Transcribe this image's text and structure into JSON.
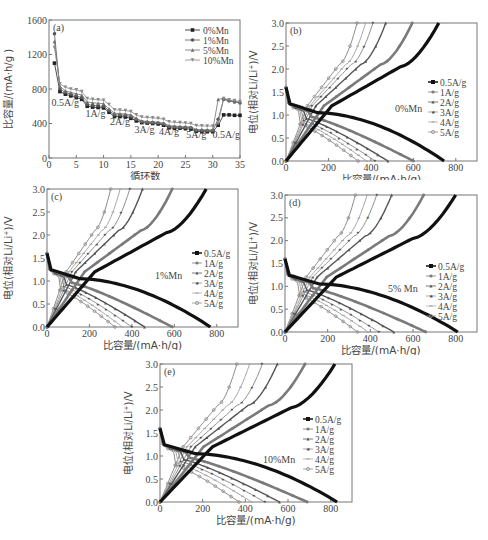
{
  "chart_data": [
    {
      "id": "a",
      "type": "scatter",
      "panel_label": "(a)",
      "xlabel": "循环数",
      "ylabel": "比容量/(mA·h/g )",
      "xlim": [
        0,
        35
      ],
      "ylim": [
        0,
        1600
      ],
      "xticks": [
        0,
        5,
        10,
        15,
        20,
        25,
        30,
        35
      ],
      "yticks": [
        0,
        400,
        800,
        1200,
        1600
      ],
      "legend": [
        "0%Mn",
        "1%Mn",
        "5%Mn",
        "10%Mn"
      ],
      "legend_position": "upper right",
      "annotations": [
        {
          "text": "0.5A/g",
          "x": 3,
          "y": 600
        },
        {
          "text": "1A/g",
          "x": 8.5,
          "y": 470
        },
        {
          "text": "2A/g",
          "x": 13,
          "y": 380
        },
        {
          "text": "3A/g",
          "x": 17.5,
          "y": 290
        },
        {
          "text": "4A/g",
          "x": 22,
          "y": 270
        },
        {
          "text": "5A/g",
          "x": 27,
          "y": 235
        },
        {
          "text": "0.5A/g",
          "x": 32.5,
          "y": 235
        }
      ],
      "x": [
        1,
        2,
        3,
        4,
        5,
        6,
        7,
        8,
        9,
        10,
        11,
        12,
        13,
        14,
        15,
        16,
        17,
        18,
        19,
        20,
        21,
        22,
        23,
        24,
        25,
        26,
        27,
        28,
        29,
        30,
        31,
        32,
        33,
        34,
        35
      ],
      "series": [
        {
          "name": "0%Mn",
          "marker": "square",
          "values": [
            1100,
            770,
            740,
            720,
            700,
            680,
            600,
            590,
            585,
            580,
            530,
            480,
            480,
            475,
            460,
            430,
            410,
            405,
            400,
            395,
            380,
            350,
            345,
            345,
            340,
            335,
            310,
            305,
            305,
            305,
            380,
            500,
            500,
            495,
            495
          ]
        },
        {
          "name": "1%Mn",
          "marker": "circle",
          "values": [
            1440,
            800,
            760,
            740,
            720,
            700,
            620,
            610,
            605,
            600,
            550,
            500,
            500,
            495,
            480,
            450,
            420,
            415,
            410,
            405,
            395,
            365,
            360,
            355,
            355,
            350,
            320,
            320,
            318,
            318,
            450,
            680,
            660,
            650,
            640
          ]
        },
        {
          "name": "5%Mn",
          "marker": "triangle-up",
          "values": [
            1350,
            830,
            780,
            760,
            745,
            730,
            650,
            640,
            635,
            630,
            570,
            520,
            515,
            510,
            500,
            460,
            430,
            425,
            420,
            415,
            405,
            375,
            370,
            365,
            362,
            360,
            330,
            328,
            326,
            325,
            680,
            690,
            670,
            655,
            645
          ]
        },
        {
          "name": "10%Mn",
          "marker": "triangle-down",
          "values": [
            1280,
            860,
            820,
            800,
            790,
            770,
            690,
            680,
            675,
            670,
            620,
            560,
            555,
            550,
            540,
            500,
            475,
            470,
            465,
            460,
            450,
            420,
            415,
            410,
            405,
            400,
            375,
            372,
            370,
            370,
            400,
            690,
            675,
            665,
            655
          ]
        }
      ]
    },
    {
      "id": "b",
      "type": "line",
      "panel_label": "(b)",
      "sample": "0%Mn",
      "xlabel": "比容量/(mA·h/g)",
      "ylabel": "电位(相对Li/Li⁺)/V",
      "xlim": [
        0,
        900
      ],
      "ylim": [
        0,
        3.0
      ],
      "xticks": [
        0,
        200,
        400,
        600,
        800
      ],
      "yticks": [
        0.0,
        0.5,
        1.0,
        1.5,
        2.0,
        2.5,
        3.0
      ],
      "legend": [
        "0.5A/g",
        "1A/g",
        "2A/g",
        "3A/g",
        "4A/g",
        "5A/g"
      ],
      "discharge_capacity": [
        745,
        600,
        480,
        420,
        380,
        340
      ],
      "charge_capacity": [
        720,
        595,
        470,
        410,
        375,
        335
      ]
    },
    {
      "id": "c",
      "type": "line",
      "panel_label": "(c)",
      "sample": "1%Mn",
      "xlabel": "比容量/(mA·h/g)",
      "ylabel": "电位(相对Li/Li⁺)/V",
      "xlim": [
        0,
        900
      ],
      "ylim": [
        0,
        3.0
      ],
      "xticks": [
        0,
        200,
        400,
        600,
        800
      ],
      "yticks": [
        0.0,
        0.5,
        1.0,
        1.5,
        2.0,
        2.5,
        3.0
      ],
      "legend": [
        "0.5A/g",
        "1A/g",
        "2A/g",
        "3A/g",
        "4A/g",
        "5A/g"
      ],
      "discharge_capacity": [
        770,
        590,
        460,
        400,
        355,
        320
      ],
      "charge_capacity": [
        750,
        590,
        450,
        390,
        345,
        300
      ]
    },
    {
      "id": "d",
      "type": "line",
      "panel_label": "(d)",
      "sample": "5% Mn",
      "xlabel": "比容量/(mA·h/g)",
      "ylabel": "电位(相对Li/Li⁺)/V",
      "xlim": [
        0,
        900
      ],
      "ylim": [
        0,
        3.0
      ],
      "xticks": [
        0,
        200,
        400,
        600,
        800
      ],
      "yticks": [
        0.0,
        0.5,
        1.0,
        1.5,
        2.0,
        2.5,
        3.0
      ],
      "legend": [
        "0.5A/g",
        "1A/g",
        "2A/g",
        "3A/g",
        "4A/g",
        "5A/g"
      ],
      "discharge_capacity": [
        810,
        660,
        510,
        440,
        390,
        340
      ],
      "charge_capacity": [
        800,
        650,
        500,
        430,
        385,
        330
      ]
    },
    {
      "id": "e",
      "type": "line",
      "panel_label": "(e)",
      "sample": "10%Mn",
      "xlabel": "比容量/(mA·h/g)",
      "ylabel": "电位(相对Li/Li⁺)/V",
      "xlim": [
        0,
        900
      ],
      "ylim": [
        0,
        3.0
      ],
      "xticks": [
        0,
        200,
        400,
        600,
        800
      ],
      "yticks": [
        0.0,
        0.5,
        1.0,
        1.5,
        2.0,
        2.5,
        3.0
      ],
      "legend": [
        "0.5A/g",
        "1A/g",
        "2A/g",
        "3A/g",
        "4A/g",
        "5A/g"
      ],
      "discharge_capacity": [
        830,
        690,
        560,
        490,
        430,
        370
      ],
      "charge_capacity": [
        820,
        680,
        550,
        480,
        420,
        360
      ]
    }
  ],
  "styles": {
    "rate_colors": [
      "#111111",
      "#7a7a7a",
      "#555555",
      "#909090",
      "#a8a8a8",
      "#8c8c8c"
    ],
    "rate_widths": [
      3.2,
      2.6,
      1.4,
      1.0,
      1.0,
      1.0
    ],
    "rate_markers": [
      "square",
      "circle",
      "triangle-up",
      "star",
      "dash",
      "circle-open"
    ],
    "series_a_colors": [
      "#222222",
      "#555555",
      "#6e6e6e",
      "#888888"
    ]
  }
}
